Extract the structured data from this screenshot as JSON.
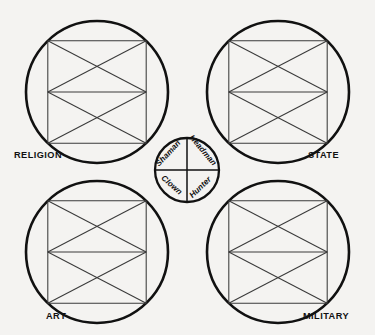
{
  "figure": {
    "background_color": "#f4f3f1",
    "outline_color": "#111111",
    "lattice_color": "#3a3a3a"
  },
  "corner_labels": [
    {
      "id": "religion",
      "text": "RELIGION",
      "x": 14,
      "y": 158,
      "anchor": "start"
    },
    {
      "id": "state",
      "text": "STATE",
      "x": 308,
      "y": 158,
      "anchor": "start"
    },
    {
      "id": "art",
      "text": "ART",
      "x": 46,
      "y": 319,
      "anchor": "start"
    },
    {
      "id": "military",
      "text": "MILITARY",
      "x": 303,
      "y": 319,
      "anchor": "start"
    }
  ],
  "large_circles": [
    {
      "id": "religion-circle",
      "cx": 97,
      "cy": 92,
      "r": 71
    },
    {
      "id": "state-circle",
      "cx": 278,
      "cy": 92,
      "r": 71
    },
    {
      "id": "art-circle",
      "cx": 97,
      "cy": 252,
      "r": 71
    },
    {
      "id": "military-circle",
      "cx": 278,
      "cy": 252,
      "r": 71
    }
  ],
  "center_circle": {
    "id": "center-circle",
    "cx": 187,
    "cy": 170,
    "r": 32
  },
  "inner_labels": [
    {
      "id": "shaman",
      "text": "Shaman",
      "x": 170,
      "y": 155,
      "rotate": -47
    },
    {
      "id": "headman",
      "text": "Headman",
      "x": 197,
      "y": 147,
      "rotate": 50
    },
    {
      "id": "clown",
      "text": "Clown",
      "x": 165,
      "y": 184,
      "rotate": 41
    },
    {
      "id": "hunter",
      "text": "Hunter",
      "x": 196,
      "y": 187,
      "rotate": -44
    }
  ]
}
